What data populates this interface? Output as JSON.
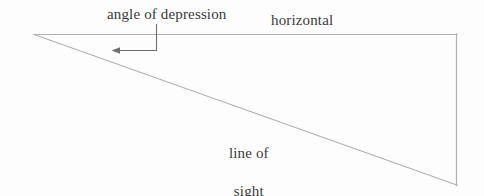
{
  "diagram": {
    "background_color": "#fdfdfd",
    "line_color": "#b0b0b0",
    "text_color": "#3a3a3a",
    "labels": {
      "angle_of_depression": "angle of depression",
      "horizontal": "horizontal",
      "line_of_sight_line1": "line of",
      "line_of_sight_line2": "sight"
    },
    "geometry": {
      "apex": {
        "x": 34,
        "y": 34
      },
      "top_right": {
        "x": 457,
        "y": 34
      },
      "bottom_right": {
        "x": 457,
        "y": 185
      },
      "horizontal_line": {
        "x1": 34,
        "y1": 34,
        "x2": 457,
        "y2": 34
      },
      "line_of_sight": {
        "x1": 34,
        "y1": 34,
        "x2": 457,
        "y2": 185
      },
      "vertical_side": {
        "x1": 457,
        "y1": 34,
        "x2": 457,
        "y2": 185
      },
      "leader_vertical": {
        "x1": 156,
        "y1": 24,
        "x2": 156,
        "y2": 50
      },
      "leader_horizontal": {
        "x1": 156,
        "y1": 50,
        "x2": 114,
        "y2": 50
      },
      "arrow_tip": {
        "x": 112,
        "y": 50
      }
    }
  }
}
